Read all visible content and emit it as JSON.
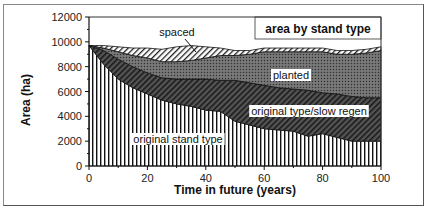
{
  "chart_data": {
    "type": "area",
    "title": "area by stand type",
    "xlabel": "Time in future (years)",
    "ylabel": "Area (ha)",
    "xlim": [
      0,
      100
    ],
    "ylim": [
      0,
      12000
    ],
    "x_ticks": [
      0,
      20,
      40,
      60,
      80,
      100
    ],
    "y_ticks": [
      0,
      2000,
      4000,
      6000,
      8000,
      10000,
      12000
    ],
    "stacked": true,
    "grid": false,
    "x": [
      0,
      5,
      10,
      15,
      20,
      25,
      30,
      35,
      40,
      45,
      50,
      55,
      60,
      65,
      70,
      75,
      80,
      85,
      90,
      95,
      100
    ],
    "series": [
      {
        "name": "original stand type",
        "pattern": "vertical-lines",
        "values": [
          9700,
          8200,
          7000,
          6300,
          5800,
          5300,
          5000,
          4800,
          4500,
          4400,
          3600,
          3300,
          3000,
          2900,
          2800,
          2400,
          2600,
          2300,
          2000,
          2000,
          2000
        ]
      },
      {
        "name": "original type/slow regen",
        "pattern": "dense-diagonal-hatch",
        "values": [
          0,
          1100,
          1600,
          1700,
          1700,
          1800,
          2000,
          2200,
          2500,
          2500,
          3300,
          3400,
          3500,
          3400,
          3400,
          3700,
          3300,
          3500,
          3600,
          3500,
          3500
        ]
      },
      {
        "name": "planted",
        "pattern": "dark-stipple",
        "values": [
          0,
          200,
          600,
          900,
          1200,
          1300,
          1400,
          1500,
          1700,
          2000,
          2000,
          2300,
          2700,
          2900,
          3000,
          3100,
          3300,
          3200,
          3400,
          3600,
          3800
        ]
      },
      {
        "name": "spaced",
        "pattern": "light-diagonal-hatch",
        "values": [
          0,
          200,
          400,
          600,
          800,
          1000,
          1200,
          1200,
          900,
          600,
          400,
          300,
          300,
          300,
          300,
          300,
          300,
          300,
          300,
          300,
          300
        ]
      }
    ],
    "annotations": [
      "spaced",
      "planted",
      "original type/slow regen",
      "original stand type"
    ],
    "legend_position": "top-right box"
  },
  "labels": {
    "title_box": "area by stand type",
    "xlabel": "Time in future (years)",
    "ylabel": "Area (ha)",
    "spaced": "spaced",
    "planted": "planted",
    "slow_regen": "original type/slow regen",
    "original": "original stand type"
  }
}
